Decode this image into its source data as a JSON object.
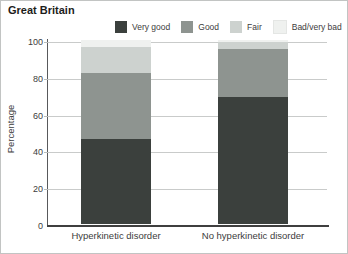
{
  "chart_data": {
    "type": "bar",
    "stacked": true,
    "title": "Great Britain",
    "categories": [
      "Hyperkinetic disorder",
      "No hyperkinetic disorder"
    ],
    "series": [
      {
        "name": "Very good",
        "values": [
          46,
          69
        ],
        "color": "#3b403d"
      },
      {
        "name": "Good",
        "values": [
          36,
          26
        ],
        "color": "#8e9490"
      },
      {
        "name": "Fair",
        "values": [
          14,
          4
        ],
        "color": "#cdd2cf"
      },
      {
        "name": "Bad/very bad",
        "values": [
          4,
          1
        ],
        "color": "#eff1ef"
      }
    ],
    "ylabel": "Percentage",
    "ylim": [
      0,
      100
    ],
    "y_ticks": [
      0,
      20,
      40,
      60,
      80,
      100
    ],
    "grid": true,
    "legend_position": "top"
  },
  "axes": {
    "y_label": "Percentage",
    "y_ticks": [
      0,
      20,
      40,
      60,
      80,
      100
    ]
  },
  "colors": {
    "very_good": "#3b403d",
    "good": "#8e9490",
    "fair": "#cdd2cf",
    "bad_very_bad": "#eff1ef",
    "gridline": "#c9cbca",
    "axis": "#58595b",
    "text": "#3c3c3c"
  }
}
